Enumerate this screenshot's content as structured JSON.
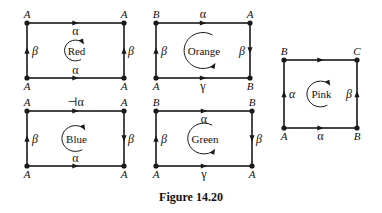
{
  "figure": {
    "caption": "Figure 14.20",
    "stroke_color": "#1a1a1a",
    "background": "#ffffff"
  },
  "rects": [
    {
      "name": "Red",
      "x1": 27,
      "y1": 23,
      "x2": 124,
      "y2": 78,
      "vertices": {
        "tl": "A",
        "tr": "A",
        "bl": "A",
        "br": "A"
      },
      "edges": {
        "top": {
          "label": "α",
          "arrow": "right",
          "label_side": "below"
        },
        "bottom": {
          "label": "α",
          "arrow": "right",
          "label_side": "above"
        },
        "left": {
          "label": "β",
          "arrow": "up"
        },
        "right": {
          "label": "β",
          "arrow": "up"
        }
      },
      "rotation": "clockwise"
    },
    {
      "name": "Orange",
      "x1": 156,
      "y1": 23,
      "x2": 250,
      "y2": 78,
      "vertices": {
        "tl": "B",
        "tr": "A",
        "bl": "A",
        "br": "B"
      },
      "edges": {
        "top": {
          "label": "α",
          "arrow": "right",
          "label_side": "above"
        },
        "bottom": {
          "label": "γ",
          "arrow": "right",
          "label_side": "below"
        },
        "left": {
          "label": "β",
          "arrow": "up"
        },
        "right": {
          "label": "β",
          "arrow": "down",
          "label_left": true
        }
      },
      "rotation": "counterclockwise"
    },
    {
      "name": "Blue",
      "x1": 27,
      "y1": 111,
      "x2": 124,
      "y2": 166,
      "vertices": {
        "tl": "A",
        "tr": "A",
        "bl": "A",
        "br": "A"
      },
      "edges": {
        "top": {
          "label": "⊣α",
          "arrow": "right",
          "label_side": "above"
        },
        "bottom": {
          "label": "α",
          "arrow": "right",
          "label_side": "above"
        },
        "left": {
          "label": "β",
          "arrow": "up"
        },
        "right": {
          "label": "β",
          "arrow": "down"
        }
      },
      "rotation": "clockwise"
    },
    {
      "name": "Green",
      "x1": 156,
      "y1": 111,
      "x2": 252,
      "y2": 166,
      "vertices": {
        "tl": "B",
        "tr": "B",
        "bl": "A",
        "br": "A"
      },
      "edges": {
        "top": {
          "label": "α",
          "arrow": "right",
          "label_side": "below"
        },
        "bottom": {
          "label": "γ",
          "arrow": "right",
          "label_side": "below"
        },
        "left": {
          "label": "β",
          "arrow": "up"
        },
        "right": {
          "label": "β",
          "arrow": "down"
        }
      },
      "rotation": "counterclockwise"
    },
    {
      "name": "Pink",
      "x1": 284,
      "y1": 60,
      "x2": 357,
      "y2": 128,
      "vertices": {
        "tl": "B",
        "tr": "C",
        "bl": "A",
        "br": "B"
      },
      "edges": {
        "top": {
          "label": "",
          "arrow": "right",
          "label_side": "above"
        },
        "bottom": {
          "label": "α",
          "arrow": "right",
          "label_side": "below"
        },
        "left": {
          "label": "α",
          "arrow": "up"
        },
        "right": {
          "label": "β",
          "arrow": "up",
          "label_left": true
        }
      },
      "rotation": "clockwise"
    }
  ]
}
